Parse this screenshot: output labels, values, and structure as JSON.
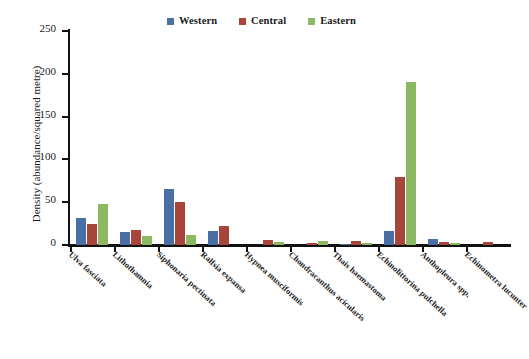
{
  "chart_data": {
    "type": "bar",
    "title": "",
    "xlabel": "",
    "ylabel": "Density (abundance/squared metre)",
    "ylim": [
      0,
      250
    ],
    "yticks": [
      0,
      50,
      100,
      150,
      200,
      250
    ],
    "grid": false,
    "legend_position": "top-center",
    "categories": [
      "Ulva fasciata",
      "Lithothamnia",
      "Siphonaria pectinata",
      "Ralfsia expansa",
      "Hypnea musciformis",
      "Chondracanthus acicularis",
      "Thais haemastoma",
      "Echinolittorina pulchella",
      "Anthopleura spp.",
      "Echinometra lucunter"
    ],
    "series": [
      {
        "name": "Western",
        "color": "#4a6fa5",
        "values": [
          32,
          15,
          65,
          16,
          0,
          0,
          1,
          16,
          7,
          0
        ]
      },
      {
        "name": "Central",
        "color": "#a8453a",
        "values": [
          24,
          18,
          50,
          22,
          6,
          2,
          5,
          79,
          3,
          3
        ]
      },
      {
        "name": "Eastern",
        "color": "#8cb863",
        "values": [
          48,
          11,
          12,
          0,
          3,
          5,
          2,
          191,
          2,
          0
        ]
      }
    ]
  }
}
